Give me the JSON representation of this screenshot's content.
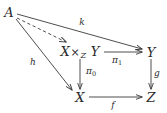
{
  "diagram": {
    "type": "commutative-diagram",
    "stroke_color": "#3a3a3a",
    "text_color": "#2b2b2b",
    "background": "#ffffff",
    "nodes": [
      {
        "id": "A",
        "label": "A",
        "x": 9,
        "y": 12
      },
      {
        "id": "pullback",
        "label": "X ×Z Y",
        "base1": "X",
        "times": "×",
        "sub": "Z",
        "base2": "Y",
        "x": 80,
        "y": 52
      },
      {
        "id": "Y",
        "label": "Y",
        "x": 151,
        "y": 52
      },
      {
        "id": "X",
        "label": "X",
        "x": 80,
        "y": 97
      },
      {
        "id": "Z",
        "label": "Z",
        "x": 151,
        "y": 97
      }
    ],
    "arrows": [
      {
        "id": "a-to-pullback",
        "from": "A",
        "to": "pullback",
        "style": "dashed",
        "label": ""
      },
      {
        "id": "a-to-y",
        "from": "A",
        "to": "Y",
        "style": "solid",
        "label": "k"
      },
      {
        "id": "a-to-x",
        "from": "A",
        "to": "X",
        "style": "solid",
        "label": "h"
      },
      {
        "id": "pullback-to-y",
        "from": "pullback",
        "to": "Y",
        "style": "solid",
        "label": "π1"
      },
      {
        "id": "pullback-to-x",
        "from": "pullback",
        "to": "X",
        "style": "solid",
        "label": "π0"
      },
      {
        "id": "y-to-z",
        "from": "Y",
        "to": "Z",
        "style": "solid",
        "label": "g"
      },
      {
        "id": "x-to-z",
        "from": "X",
        "to": "Z",
        "style": "solid",
        "label": "f"
      }
    ],
    "labels": {
      "k": {
        "text": "k",
        "x": 82,
        "y": 22
      },
      "h": {
        "text": "h",
        "x": 33,
        "y": 62
      },
      "pi1_pi": {
        "text": "π",
        "x": 0,
        "y": 0
      },
      "pi1_idx": {
        "text": "1"
      },
      "pi1": {
        "x": 117,
        "y": 61
      },
      "pi0_pi": {
        "text": "π"
      },
      "pi0_idx": {
        "text": "0"
      },
      "pi0": {
        "x": 91,
        "y": 72
      },
      "g": {
        "text": "g",
        "x": 157,
        "y": 73
      },
      "f": {
        "text": "f",
        "x": 113,
        "y": 105
      }
    }
  }
}
